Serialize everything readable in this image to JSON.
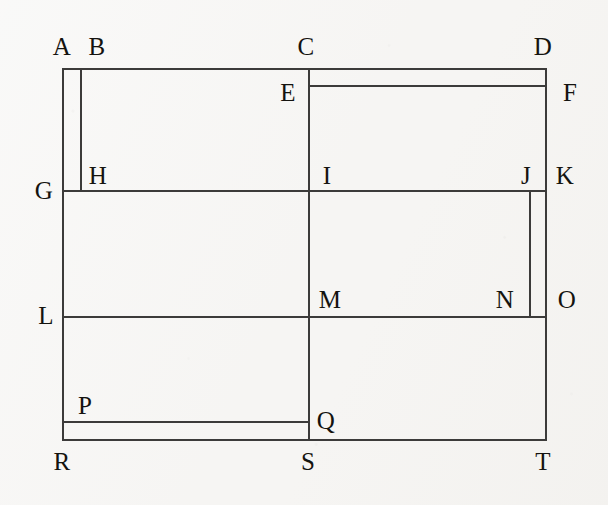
{
  "figure": {
    "colors": {
      "background": "#f6f5f3",
      "line": "#3c3b3a",
      "label_text": "#14130f"
    },
    "canvas": {
      "width": 608,
      "height": 505
    },
    "bounds": {
      "left": 62,
      "top": 68,
      "right": 545,
      "bottom": 439
    },
    "label_font_size": 25
  },
  "vertices": [
    {
      "id": "A",
      "label": "A",
      "x": 62,
      "y": 46
    },
    {
      "id": "B",
      "label": "B",
      "x": 97,
      "y": 46
    },
    {
      "id": "C",
      "label": "C",
      "x": 306,
      "y": 46
    },
    {
      "id": "D",
      "label": "D",
      "x": 543,
      "y": 46
    },
    {
      "id": "E",
      "label": "E",
      "x": 288,
      "y": 92
    },
    {
      "id": "F",
      "label": "F",
      "x": 570,
      "y": 92
    },
    {
      "id": "G",
      "label": "G",
      "x": 44,
      "y": 190
    },
    {
      "id": "H",
      "label": "H",
      "x": 98,
      "y": 175
    },
    {
      "id": "I",
      "label": "I",
      "x": 327,
      "y": 175
    },
    {
      "id": "J",
      "label": "J",
      "x": 526,
      "y": 175
    },
    {
      "id": "K",
      "label": "K",
      "x": 565,
      "y": 175
    },
    {
      "id": "L",
      "label": "L",
      "x": 46,
      "y": 315
    },
    {
      "id": "M",
      "label": "M",
      "x": 330,
      "y": 299
    },
    {
      "id": "N",
      "label": "N",
      "x": 505,
      "y": 299
    },
    {
      "id": "O",
      "label": "O",
      "x": 567,
      "y": 299
    },
    {
      "id": "P",
      "label": "P",
      "x": 85,
      "y": 405
    },
    {
      "id": "Q",
      "label": "Q",
      "x": 326,
      "y": 420
    },
    {
      "id": "R",
      "label": "R",
      "x": 62,
      "y": 461
    },
    {
      "id": "S",
      "label": "S",
      "x": 308,
      "y": 461
    },
    {
      "id": "T",
      "label": "T",
      "x": 543,
      "y": 461
    }
  ],
  "segments": {
    "horizontal": [
      {
        "name": "segment-A-B-C-D",
        "from": "A",
        "to": "D",
        "x": 62,
        "y": 68,
        "length": 485
      },
      {
        "name": "segment-E-F",
        "from": "E",
        "to": "F",
        "x": 308,
        "y": 85,
        "length": 239
      },
      {
        "name": "segment-G-H-I-J-K",
        "from": "G",
        "to": "K",
        "x": 62,
        "y": 190,
        "length": 485
      },
      {
        "name": "segment-L-M-N-O",
        "from": "L",
        "to": "O",
        "x": 62,
        "y": 316,
        "length": 485
      },
      {
        "name": "segment-P-Q",
        "from": "P",
        "to": "Q",
        "x": 62,
        "y": 421,
        "length": 248
      },
      {
        "name": "segment-R-S-T",
        "from": "R",
        "to": "T",
        "x": 62,
        "y": 439,
        "length": 485
      }
    ],
    "vertical": [
      {
        "name": "segment-A-G-L-R",
        "from": "A",
        "to": "R",
        "x": 62,
        "y": 68,
        "length": 373
      },
      {
        "name": "segment-B-H",
        "from": "B",
        "to": "H",
        "x": 80,
        "y": 68,
        "length": 124
      },
      {
        "name": "segment-C-E-I-M-S",
        "from": "C",
        "to": "S",
        "x": 308,
        "y": 68,
        "length": 373
      },
      {
        "name": "segment-J-N",
        "from": "J",
        "to": "N",
        "x": 529,
        "y": 190,
        "length": 128
      },
      {
        "name": "segment-D-F-K-O-T",
        "from": "D",
        "to": "T",
        "x": 545,
        "y": 68,
        "length": 373
      }
    ]
  }
}
